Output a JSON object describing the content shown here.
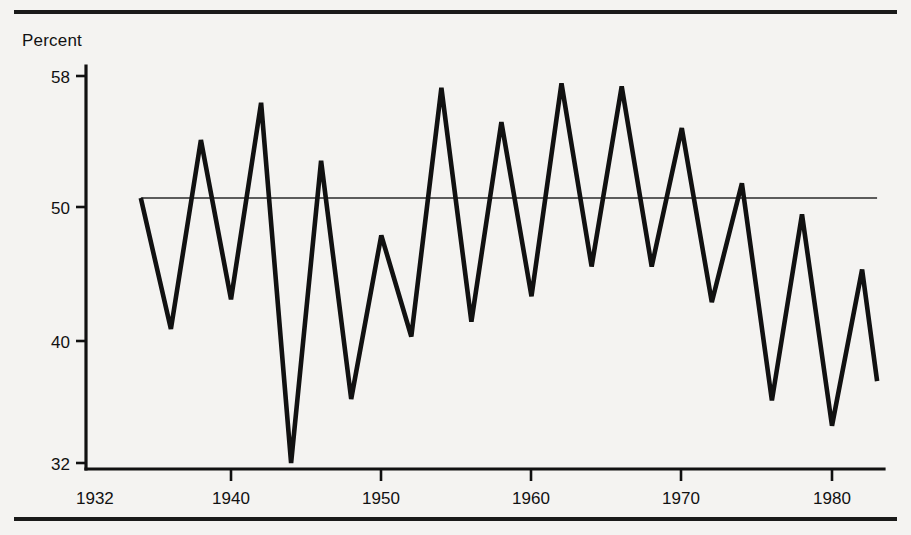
{
  "figure": {
    "y_axis_title": "Percent",
    "y_ticks": [
      "58",
      "50",
      "40",
      "32"
    ],
    "x_ticks": [
      "1932",
      "1940",
      "1950",
      "1960",
      "1970",
      "1980"
    ],
    "colors": {
      "line": "#111111",
      "axis": "#111111",
      "reference_line": "#2a2a2a",
      "background": "#f4f3f1"
    }
  },
  "chart_data": {
    "type": "line",
    "title": "",
    "subtitle": "",
    "xlabel": "",
    "ylabel": "Percent",
    "xlim": [
      1932,
      1983
    ],
    "ylim": [
      31,
      58.6
    ],
    "grid": false,
    "legend": "none",
    "xtick_values": [
      1932,
      1940,
      1950,
      1960,
      1970,
      1980
    ],
    "xtick_labels": [
      "1932",
      "1940",
      "1950",
      "1960",
      "1970",
      "1980"
    ],
    "ytick_values": [
      58,
      50,
      40,
      32
    ],
    "ytick_labels": [
      "58",
      "50",
      "40",
      "32"
    ],
    "annotations": [
      {
        "type": "horizontal-reference-line",
        "value": 49.8,
        "label": "",
        "x_from": 1934,
        "x_to": 1983
      }
    ],
    "series": [
      {
        "name": "Percent",
        "x": [
          1934,
          1936,
          1938,
          1940,
          1942,
          1944,
          1946,
          1948,
          1950,
          1952,
          1954,
          1956,
          1958,
          1960,
          1962,
          1964,
          1966,
          1968,
          1970,
          1972,
          1974,
          1976,
          1978,
          1980,
          1982
        ],
        "values": [
          49.8,
          41.0,
          53.7,
          43.0,
          56.2,
          32.0,
          52.3,
          36.3,
          47.3,
          40.5,
          57.2,
          41.5,
          54.9,
          43.2,
          57.5,
          45.2,
          57.3,
          45.2,
          54.5,
          42.8,
          50.8,
          36.2,
          48.7,
          34.5,
          45.0
        ],
        "last_value": 37.5
      }
    ]
  }
}
